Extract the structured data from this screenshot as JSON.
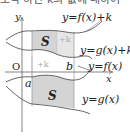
{
  "caption": "조작 하인 k의 값에 대하여",
  "labels": {
    "y_axis": "y",
    "x_axis": "x",
    "origin": "O",
    "a": "a",
    "b": "b",
    "curve_f_plus_k": "y=f(x)+k",
    "curve_g_plus_k": "y=g(x)+k",
    "curve_f": "y=f(x)",
    "curve_g": "y=g(x)",
    "region_upper": "S",
    "region_lower": "S",
    "shift_upper": "+k",
    "shift_lower": "+k"
  },
  "colors": {
    "shade": "#d4d4d4",
    "shade_light": "#e6e6e6",
    "line": "#555555",
    "axis": "#666666"
  }
}
